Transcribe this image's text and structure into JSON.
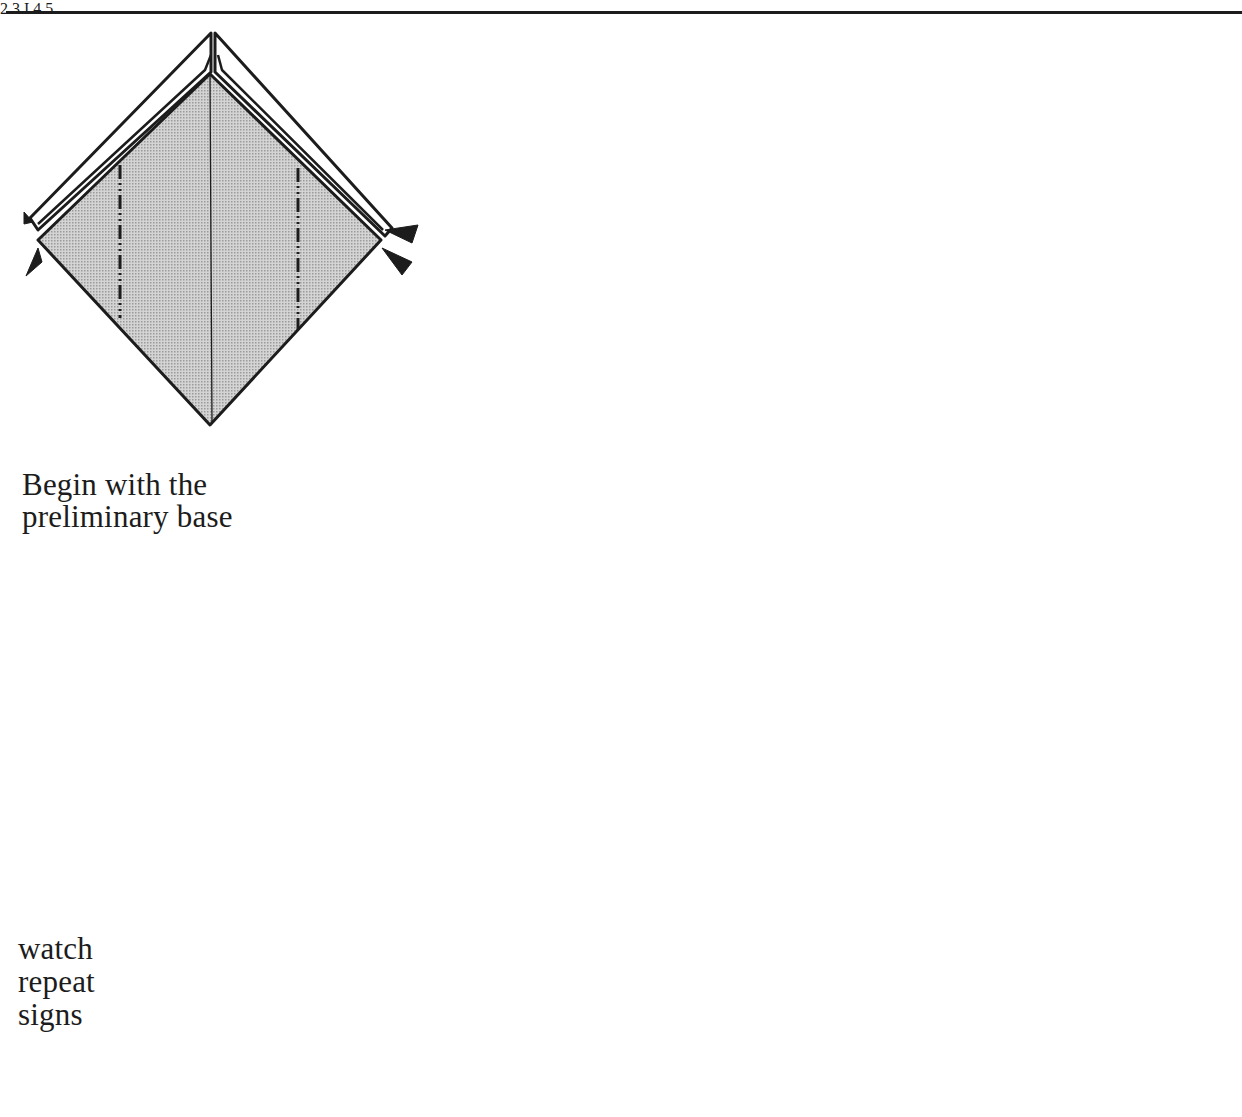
{
  "page": {
    "rule": "top-horizontal-rule"
  },
  "captions": {
    "begin": [
      "Begin with the",
      "preliminary base"
    ],
    "repeat": [
      "watch",
      "repeat",
      "signs"
    ]
  },
  "steps": [
    {
      "number": "1",
      "label": "I",
      "description": "Preliminary base with mountain-fold lines and reverse-fold arrow markers on both side corners"
    },
    {
      "number": "2",
      "label": "2",
      "description": "Elongated hexagon with valley-fold line and downward arrow; repeat sign with 3 strokes"
    },
    {
      "number": "3",
      "label": "3",
      "description": "Partially folded form with upward arrows at top, valley-fold dashed diagonals and curved arrows; repeat sign with 3 strokes"
    },
    {
      "number": "4",
      "label": "4",
      "description": "Heart-like shape with upward arrow and valley fold; repeat sign with 3 strokes"
    },
    {
      "number": "5",
      "label": "5",
      "description": "Form with up arrow, left and right pulling arrows, down arrow, and mountain-fold dash-dot line"
    },
    {
      "number": "6",
      "label": "",
      "description": "Finished 3D flower/star form mounted on a thick diagonal stick"
    }
  ],
  "symbols": {
    "turn_over": "turn-over-arrow",
    "repeat_sign_strokes": 3
  },
  "colors": {
    "ink": "#1c1c1c",
    "screentone": "#c9c9c9",
    "paper": "#ffffff"
  }
}
